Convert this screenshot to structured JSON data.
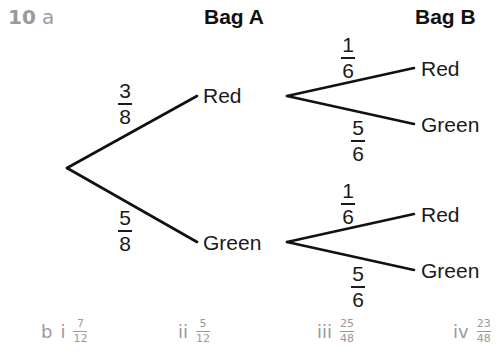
{
  "question": {
    "number": "10",
    "part_a": "a",
    "part_b": "b"
  },
  "headers": {
    "bag_a": "Bag A",
    "bag_b": "Bag B"
  },
  "tree": {
    "first": {
      "red": {
        "label": "Red",
        "prob_num": "3",
        "prob_den": "8"
      },
      "green": {
        "label": "Green",
        "prob_num": "5",
        "prob_den": "8"
      }
    },
    "second_after_red": {
      "red": {
        "label": "Red",
        "prob_num": "1",
        "prob_den": "6"
      },
      "green": {
        "label": "Green",
        "prob_num": "5",
        "prob_den": "6"
      }
    },
    "second_after_green": {
      "red": {
        "label": "Red",
        "prob_num": "1",
        "prob_den": "6"
      },
      "green": {
        "label": "Green",
        "prob_num": "5",
        "prob_den": "6"
      }
    },
    "line_color": "#111111"
  },
  "answers": [
    {
      "label": "i",
      "num": "7",
      "den": "12"
    },
    {
      "label": "ii",
      "num": "5",
      "den": "12"
    },
    {
      "label": "iii",
      "num": "25",
      "den": "48"
    },
    {
      "label": "iv",
      "num": "23",
      "den": "48"
    }
  ]
}
